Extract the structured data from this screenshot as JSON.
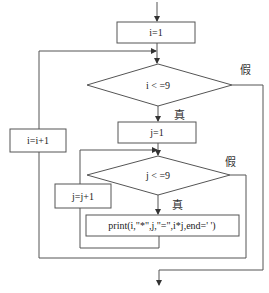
{
  "flowchart": {
    "nodes": {
      "init_i": "i=1",
      "cond_i": "i < =9",
      "init_j": "j=1",
      "cond_j": "j < =9",
      "print": "print(i,\"*\",j,\"=\",i*j,end='   ')",
      "inc_j": "j=j+1",
      "inc_i": "i=i+1"
    },
    "labels": {
      "cond_i_true": "真",
      "cond_i_false": "假",
      "cond_j_true": "真",
      "cond_j_false": "假"
    },
    "colors": {
      "stroke": "#555555",
      "text": "#222222"
    }
  }
}
